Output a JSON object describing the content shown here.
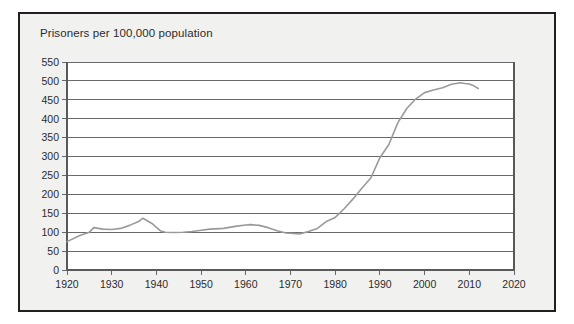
{
  "figure": {
    "title": "Prisoners per 100,000 population",
    "frame_color": "#231f20",
    "panel_background": "#f1f1f0",
    "plot_background": "#ffffff",
    "line_color": "#9a9a9a",
    "grid_color": "#58595b"
  },
  "chart_data": {
    "type": "line",
    "title": "Prisoners per 100,000 population",
    "xlabel": "",
    "ylabel": "Prisoners per 100,000 population",
    "xlim": [
      1920,
      2020
    ],
    "ylim": [
      0,
      550
    ],
    "grid": true,
    "legend": "none",
    "y_ticks": [
      0,
      50,
      100,
      150,
      200,
      250,
      300,
      350,
      400,
      450,
      500,
      550
    ],
    "y_tick_labels": [
      "0",
      "50",
      "100",
      "150",
      "200",
      "250",
      "300",
      "350",
      "400",
      "450",
      "500",
      "550"
    ],
    "x_ticks": [
      1920,
      1930,
      1940,
      1950,
      1960,
      1970,
      1980,
      1990,
      2000,
      2010,
      2020
    ],
    "x_tick_labels": [
      "1920",
      "1930",
      "1940",
      "1950",
      "1960",
      "1970",
      "1980",
      "1990",
      "2000",
      "2010",
      "2020"
    ],
    "series": [
      {
        "name": "Prisoners per 100,000 population",
        "color": "#9a9a9a",
        "x": [
          1920,
          1923,
          1925,
          1926,
          1927,
          1928,
          1930,
          1932,
          1934,
          1936,
          1937,
          1939,
          1940,
          1941,
          1942,
          1944,
          1946,
          1948,
          1950,
          1952,
          1955,
          1958,
          1960,
          1961,
          1963,
          1965,
          1967,
          1969,
          1970,
          1972,
          1974,
          1976,
          1978,
          1980,
          1982,
          1984,
          1986,
          1988,
          1990,
          1992,
          1994,
          1996,
          1998,
          2000,
          2002,
          2004,
          2006,
          2008,
          2009,
          2010,
          2011,
          2012
        ],
        "y": [
          75,
          92,
          100,
          112,
          110,
          108,
          107,
          110,
          118,
          128,
          137,
          123,
          113,
          103,
          100,
          99,
          100,
          102,
          105,
          108,
          110,
          116,
          119,
          120,
          118,
          112,
          104,
          98,
          97,
          95,
          102,
          110,
          128,
          139,
          162,
          188,
          217,
          244,
          297,
          332,
          389,
          427,
          452,
          469,
          476,
          482,
          491,
          495,
          493,
          492,
          487,
          480
        ]
      }
    ],
    "annotations": []
  }
}
